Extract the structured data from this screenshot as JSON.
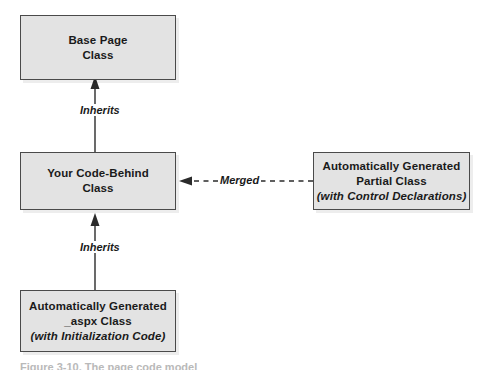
{
  "figure": {
    "background_color": "#ffffff",
    "node_fill_color": "#e3e3e3",
    "node_border_color": "#4a4a4a",
    "text_color": "#1a1a1a",
    "caption": "Figure 3-10. The page code model"
  },
  "nodes": {
    "base_page": {
      "line1": "Base Page",
      "line2": "Class"
    },
    "code_behind": {
      "line1": "Your Code-Behind",
      "line2": "Class"
    },
    "aspx_class": {
      "line1": "Automatically Generated",
      "line2": "_aspx Class",
      "line3": "(with Initialization Code)"
    },
    "partial_class": {
      "line1": "Automatically Generated",
      "line2": "Partial Class",
      "line3": "(with Control Declarations)"
    }
  },
  "edges": {
    "inherits_top": {
      "label": "Inherits",
      "style": "solid",
      "from": "code_behind",
      "to": "base_page"
    },
    "inherits_bottom": {
      "label": "Inherits",
      "style": "solid",
      "from": "aspx_class",
      "to": "code_behind"
    },
    "merged": {
      "label": "Merged",
      "style": "dashed",
      "from": "partial_class",
      "to": "code_behind"
    }
  }
}
